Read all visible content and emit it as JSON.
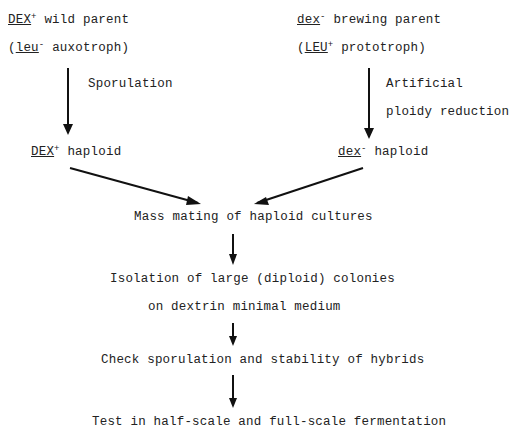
{
  "diagram": {
    "left_parent": {
      "gene": "DEX",
      "gene_sign": "+",
      "label": "wild parent",
      "marker_gene": "leu",
      "marker_sign": "-",
      "marker_label": "auxotroph)"
    },
    "right_parent": {
      "gene": "dex",
      "gene_sign": "-",
      "label": "brewing parent",
      "marker_gene": "LEU",
      "marker_sign": "+",
      "marker_label": "prototroph)"
    },
    "left_step": "Sporulation",
    "right_step_line1": "Artificial",
    "right_step_line2": "ploidy reduction",
    "left_haploid": {
      "gene": "DEX",
      "sign": "+",
      "label": "haploid"
    },
    "right_haploid": {
      "gene": "dex",
      "sign": "-",
      "label": "haploid"
    },
    "step_mating": "Mass mating of haploid cultures",
    "step_isolation_line1": "Isolation of large (diploid) colonies",
    "step_isolation_line2": "on dextrin minimal medium",
    "step_check": "Check sporulation and stability of hybrids",
    "open_paren": "(",
    "step_final_clipped": "Test in half-scale and full-scale fermentation"
  }
}
